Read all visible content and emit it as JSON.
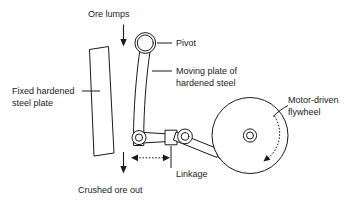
{
  "diagram": {
    "background_color": "#ffffff",
    "line_color": "#1a1a1a",
    "labels": {
      "ore_lumps": "Ore lumps",
      "pivot": "Pivot",
      "moving_plate_line1": "Moving plate of",
      "moving_plate_line2": "hardened steel",
      "fixed_plate_line1": "Fixed hardened",
      "fixed_plate_line2": "steel plate",
      "motor_flywheel_line1": "Motor-driven",
      "motor_flywheel_line2": "flywheel",
      "linkage": "Linkage",
      "crushed_ore_out": "Crushed ore out"
    },
    "parts": [
      {
        "name": "fixed-hardened-steel-plate",
        "label": "Fixed hardened steel plate"
      },
      {
        "name": "moving-plate-hardened-steel",
        "label": "Moving plate of hardened steel"
      },
      {
        "name": "pivot-joint",
        "label": "Pivot"
      },
      {
        "name": "linkage-assembly",
        "label": "Linkage"
      },
      {
        "name": "motor-driven-flywheel",
        "label": "Motor-driven flywheel"
      }
    ],
    "flow_arrows": [
      {
        "name": "ore-lumps-inflow-arrow",
        "direction": "down"
      },
      {
        "name": "crushed-ore-outflow-arrow",
        "direction": "down"
      },
      {
        "name": "linkage-stroke-arrow",
        "direction": "bidirectional-horizontal"
      },
      {
        "name": "flywheel-rotation-arrow",
        "direction": "counter-clockwise"
      }
    ]
  }
}
